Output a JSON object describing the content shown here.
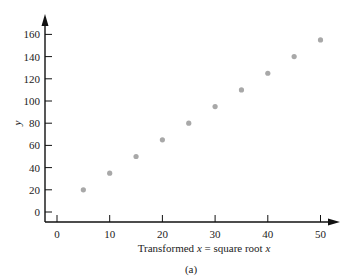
{
  "chart_data": {
    "type": "scatter",
    "title": "",
    "caption": "(a)",
    "xlabel": "Transformed x = square root x",
    "xlabel_parts": [
      "Transformed ",
      "x",
      " = square root ",
      "x"
    ],
    "ylabel": "y",
    "xlim": [
      -2,
      53
    ],
    "ylim": [
      -10,
      170
    ],
    "xticks": [
      0,
      10,
      20,
      30,
      40,
      50
    ],
    "yticks": [
      0,
      20,
      40,
      60,
      80,
      100,
      120,
      140,
      160
    ],
    "grid": false,
    "legend": null,
    "marker_color": "#a8a8a8",
    "series": [
      {
        "name": "data",
        "x": [
          5,
          10,
          15,
          20,
          25,
          30,
          35,
          40,
          45,
          50
        ],
        "y": [
          20,
          35,
          50,
          65,
          80,
          95,
          110,
          125,
          140,
          155
        ]
      }
    ]
  }
}
